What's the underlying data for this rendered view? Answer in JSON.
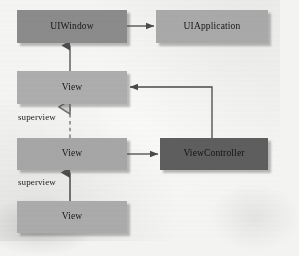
{
  "diagram": {
    "background_color": "#f4f4f2",
    "nodes": [
      {
        "id": "uiwindow",
        "label": "UIWindow",
        "color": "#8b8b8b",
        "x": 17,
        "y": 10,
        "w": 110,
        "h": 33
      },
      {
        "id": "uiapplication",
        "label": "UIApplication",
        "color": "#a9a9a9",
        "x": 156,
        "y": 10,
        "w": 112,
        "h": 33
      },
      {
        "id": "view-top",
        "label": "View",
        "color": "#adadad",
        "x": 17,
        "y": 71,
        "w": 110,
        "h": 33
      },
      {
        "id": "view-middle",
        "label": "View",
        "color": "#a6a6a6",
        "x": 17,
        "y": 138,
        "w": 110,
        "h": 32
      },
      {
        "id": "viewcontroller",
        "label": "ViewController",
        "color": "#5e5e5e",
        "x": 160,
        "y": 138,
        "w": 108,
        "h": 32
      },
      {
        "id": "view-bottom",
        "label": "View",
        "color": "#ababab",
        "x": 17,
        "y": 201,
        "w": 110,
        "h": 32
      }
    ],
    "labels": [
      {
        "id": "superview-upper",
        "text": "superview",
        "x": 18,
        "y": 112
      },
      {
        "id": "superview-lower",
        "text": "superview",
        "x": 18,
        "y": 177
      }
    ],
    "edges": [
      {
        "id": "uiwindow-to-uiapplication",
        "from": "uiwindow",
        "to": "uiapplication",
        "style": "solid",
        "arrowhead": "filled"
      },
      {
        "id": "view-top-to-uiwindow",
        "from": "view-top",
        "to": "uiwindow",
        "style": "solid",
        "arrowhead": "filled"
      },
      {
        "id": "view-middle-to-view-top",
        "from": "view-middle",
        "to": "view-top",
        "style": "dashed",
        "arrowhead": "hollow",
        "label": "superview"
      },
      {
        "id": "view-bottom-to-view-middle",
        "from": "view-bottom",
        "to": "view-middle",
        "style": "solid",
        "arrowhead": "filled",
        "label": "superview"
      },
      {
        "id": "view-middle-to-controller",
        "from": "view-middle",
        "to": "viewcontroller",
        "style": "solid",
        "arrowhead": "filled"
      },
      {
        "id": "controller-to-view-top",
        "from": "viewcontroller",
        "to": "view-top",
        "style": "solid",
        "arrowhead": "filled"
      }
    ],
    "stroke_color": "#4a4a4a"
  }
}
